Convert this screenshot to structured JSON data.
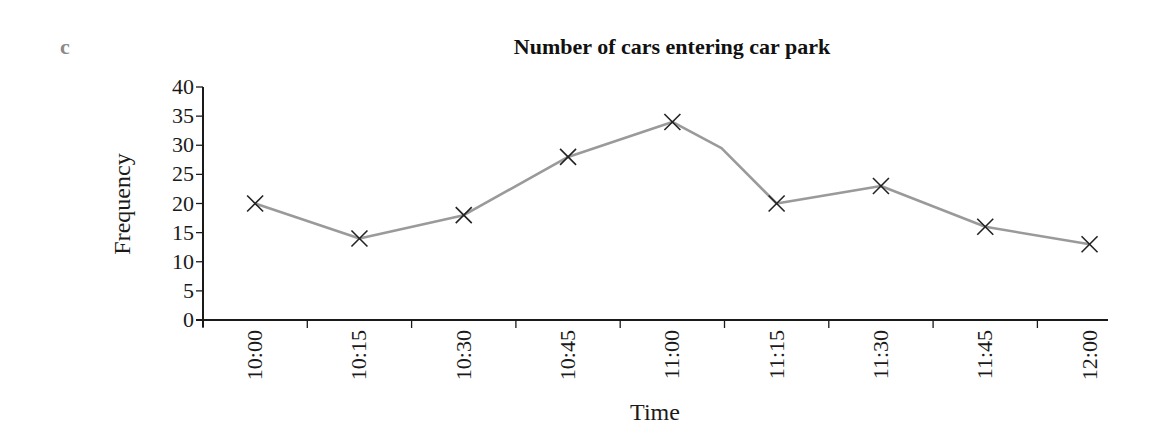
{
  "part_label": "c",
  "chart_data": {
    "type": "line",
    "title": "Number of cars entering car park",
    "xlabel": "Time",
    "ylabel": "Frequency",
    "categories": [
      "10:00",
      "10:15",
      "10:30",
      "10:45",
      "11:00",
      "11:15",
      "11:30",
      "11:45",
      "12:00"
    ],
    "series": [
      {
        "name": "Frequency",
        "values": [
          20,
          14,
          18,
          28,
          34,
          20,
          23,
          16,
          13
        ],
        "marker": "x",
        "line_color": "#9a9a9a",
        "marker_color": "#222222"
      }
    ],
    "intermediate_vertex": {
      "between": [
        "11:00",
        "11:15"
      ],
      "approx_value": 29.5
    },
    "ylim": [
      0,
      40
    ],
    "yticks": [
      0,
      5,
      10,
      15,
      20,
      25,
      30,
      35,
      40
    ],
    "grid": false,
    "legend": "none",
    "xtick_label_rotation": -90
  }
}
